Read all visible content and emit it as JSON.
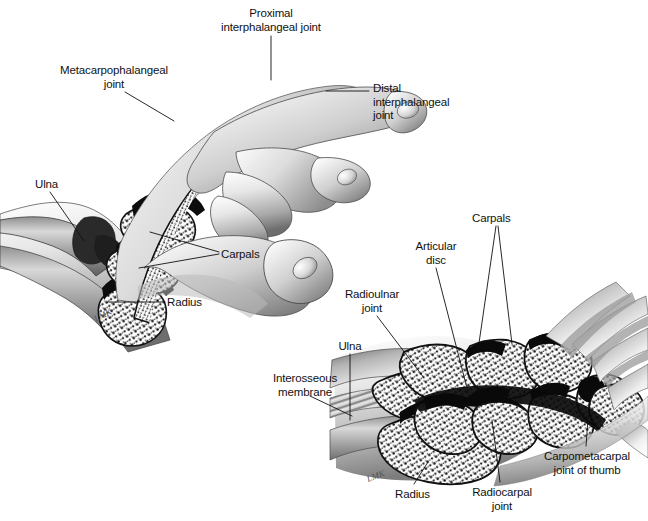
{
  "figure": {
    "background_color": "#ffffff",
    "ink_color": "#111111",
    "width": 648,
    "height": 521,
    "artist_signature": "LMK"
  },
  "panels": [
    {
      "id": "upper-hand-sagittal",
      "name": "Lateral/sagittal view of hand and wrist showing phalangeal joints",
      "labels": [
        {
          "id": "proximal-interphalangeal-joint",
          "text": "Proximal\ninterphalangeal joint",
          "align": "center",
          "x": 203,
          "y": 7,
          "w": 136
        },
        {
          "id": "metacarpophalangeal-joint",
          "text": "Metacarpophalangeal\njoint",
          "align": "center",
          "x": 50,
          "y": 64,
          "w": 128
        },
        {
          "id": "distal-interphalangeal-joint",
          "text": "Distal\ninterphalangeal\njoint",
          "align": "left",
          "x": 373,
          "y": 82,
          "w": 92
        },
        {
          "id": "ulna-upper",
          "text": "Ulna",
          "align": "left",
          "x": 35,
          "y": 178,
          "w": 40
        },
        {
          "id": "carpals-upper",
          "text": "Carpals",
          "align": "left",
          "x": 221,
          "y": 248,
          "w": 56
        },
        {
          "id": "radius-upper",
          "text": "Radius",
          "align": "left",
          "x": 167,
          "y": 296,
          "w": 52
        }
      ]
    },
    {
      "id": "lower-wrist-coronal",
      "name": "Coronal section of wrist showing carpal bones and joints",
      "labels": [
        {
          "id": "carpals-lower",
          "text": "Carpals",
          "align": "left",
          "x": 472,
          "y": 212,
          "w": 56
        },
        {
          "id": "articular-disc",
          "text": "Articular\ndisc",
          "align": "center",
          "x": 405,
          "y": 240,
          "w": 62
        },
        {
          "id": "radioulnar-joint",
          "text": "Radioulnar\njoint",
          "align": "center",
          "x": 336,
          "y": 288,
          "w": 72
        },
        {
          "id": "ulna-lower",
          "text": "Ulna",
          "align": "center",
          "x": 330,
          "y": 340,
          "w": 40
        },
        {
          "id": "interosseous-membrane",
          "text": "Interosseous\nmembrane",
          "align": "center",
          "x": 264,
          "y": 372,
          "w": 82
        },
        {
          "id": "radius-lower",
          "text": "Radius",
          "align": "left",
          "x": 395,
          "y": 488,
          "w": 52
        },
        {
          "id": "radiocarpal-joint",
          "text": "Radiocarpal\njoint",
          "align": "center",
          "x": 464,
          "y": 486,
          "w": 76
        },
        {
          "id": "carpometacarpal-joint-of-thumb",
          "text": "Carpometacarpal\njoint of thumb",
          "align": "center",
          "x": 535,
          "y": 450,
          "w": 104
        }
      ]
    }
  ],
  "anatomy_terms": [
    "Proximal interphalangeal joint",
    "Metacarpophalangeal joint",
    "Distal interphalangeal joint",
    "Ulna",
    "Carpals",
    "Radius",
    "Articular disc",
    "Radioulnar joint",
    "Interosseous membrane",
    "Radiocarpal joint",
    "Carpometacarpal joint of thumb"
  ]
}
